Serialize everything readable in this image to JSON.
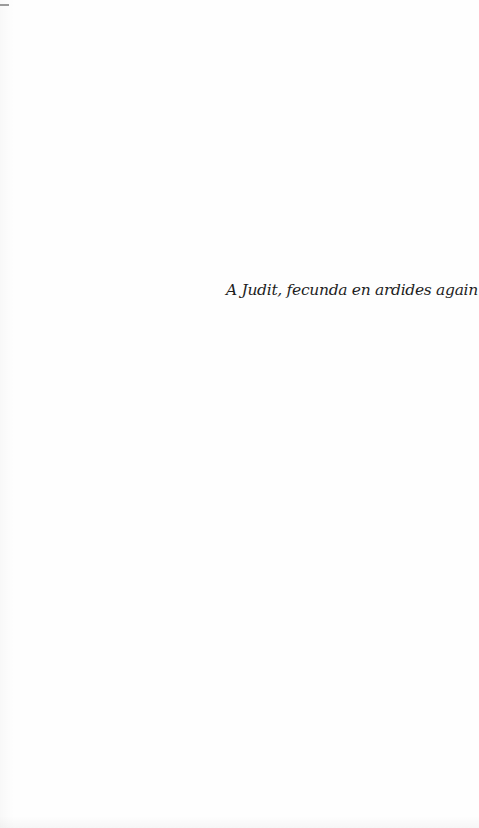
{
  "page": {
    "type": "dedication",
    "dedication_text": "A Judit, fecunda en ardides again",
    "colors": {
      "background": "#fefefe",
      "text": "#1e1e1e",
      "edge_mark": "#9a9a9a"
    }
  }
}
